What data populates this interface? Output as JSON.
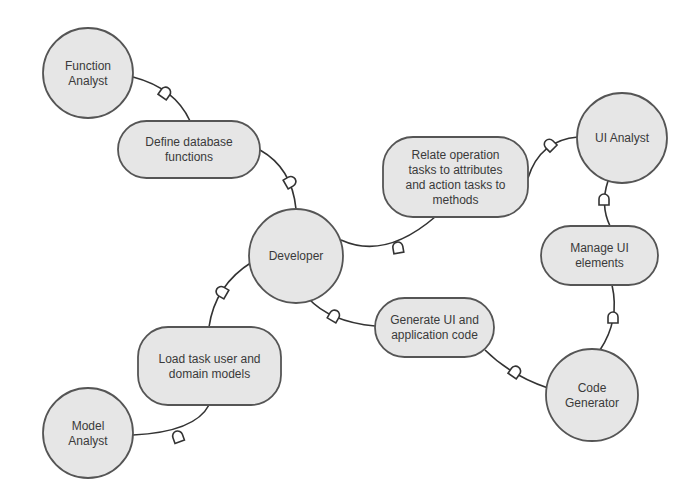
{
  "diagram": {
    "type": "collaboration-diagram",
    "colors": {
      "node_fill": "#e6e6e6",
      "node_stroke": "#555555",
      "edge": "#333333",
      "text": "#3a3a3a",
      "background": "#ffffff"
    },
    "actors": [
      {
        "id": "function_analyst",
        "lines": [
          "Function",
          "Analyst"
        ],
        "cx": 88,
        "cy": 73,
        "r": 45
      },
      {
        "id": "developer",
        "lines": [
          "Developer"
        ],
        "cx": 296,
        "cy": 256,
        "r": 47
      },
      {
        "id": "ui_analyst",
        "lines": [
          "UI Analyst"
        ],
        "cx": 622,
        "cy": 138,
        "r": 45
      },
      {
        "id": "code_generator",
        "lines": [
          "Code",
          "Generator"
        ],
        "cx": 592,
        "cy": 395,
        "r": 46
      },
      {
        "id": "model_analyst",
        "lines": [
          "Model",
          "Analyst"
        ],
        "cx": 88,
        "cy": 433,
        "r": 45
      }
    ],
    "tasks": [
      {
        "id": "define_db_functions",
        "lines": [
          "Define database",
          "functions"
        ],
        "x": 118,
        "y": 121,
        "w": 142,
        "h": 57
      },
      {
        "id": "relate_tasks",
        "lines": [
          "Relate operation",
          "tasks to attributes",
          "and action tasks to",
          "methods"
        ],
        "x": 383,
        "y": 137,
        "w": 145,
        "h": 80
      },
      {
        "id": "manage_ui_elements",
        "lines": [
          "Manage UI",
          "elements"
        ],
        "x": 541,
        "y": 226,
        "w": 117,
        "h": 59
      },
      {
        "id": "generate_code",
        "lines": [
          "Generate UI and",
          "application code"
        ],
        "x": 375,
        "y": 298,
        "w": 119,
        "h": 59
      },
      {
        "id": "load_models",
        "lines": [
          "Load task user and",
          "domain models"
        ],
        "x": 138,
        "y": 327,
        "w": 143,
        "h": 78
      }
    ],
    "edges": [
      {
        "from": "function_analyst",
        "to": "define_db_functions",
        "path": "M133,77 Q175,88 190,121",
        "connector": {
          "x": 165,
          "y": 93,
          "angle": 35
        }
      },
      {
        "from": "define_db_functions",
        "to": "developer",
        "path": "M260,150 Q292,168 296,209",
        "connector": {
          "x": 290,
          "y": 182,
          "angle": 60
        }
      },
      {
        "from": "developer",
        "to": "relate_tasks",
        "path": "M341,240 Q385,260 435,217",
        "connector": {
          "x": 398,
          "y": 248,
          "angle": -10
        }
      },
      {
        "from": "relate_tasks",
        "to": "ui_analyst",
        "path": "M528,178 Q540,140 578,137",
        "connector": {
          "x": 550,
          "y": 145,
          "angle": -45
        }
      },
      {
        "from": "ui_analyst",
        "to": "manage_ui_elements",
        "path": "M608,181 Q600,205 610,226",
        "connector": {
          "x": 604,
          "y": 200,
          "angle": 0
        }
      },
      {
        "from": "manage_ui_elements",
        "to": "code_generator",
        "path": "M612,285 Q620,320 600,350",
        "connector": {
          "x": 613,
          "y": 318,
          "angle": 0
        }
      },
      {
        "from": "developer",
        "to": "generate_code",
        "path": "M308,298 Q330,322 375,326",
        "connector": {
          "x": 334,
          "y": 316,
          "angle": 30
        }
      },
      {
        "from": "generate_code",
        "to": "code_generator",
        "path": "M485,350 Q510,375 548,388",
        "connector": {
          "x": 515,
          "y": 372,
          "angle": 35
        }
      },
      {
        "from": "developer",
        "to": "load_models",
        "path": "M252,262 Q215,285 209,327",
        "connector": {
          "x": 222,
          "y": 292,
          "angle": -60
        }
      },
      {
        "from": "load_models",
        "to": "model_analyst",
        "path": "M209,405 Q195,432 133,435",
        "connector": {
          "x": 178,
          "y": 437,
          "angle": -20
        }
      }
    ]
  }
}
